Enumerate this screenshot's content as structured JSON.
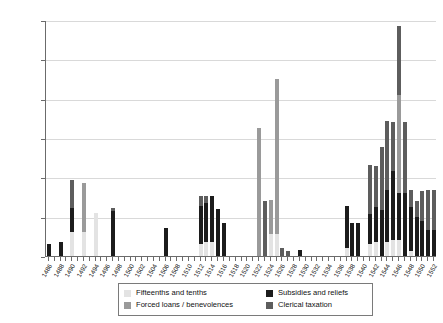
{
  "chart_data": {
    "type": "bar",
    "title": "",
    "xlabel": "",
    "ylabel": "",
    "ylim": [
      0,
      300000
    ],
    "ytick_values": [
      0,
      50000,
      100000,
      150000,
      200000,
      250000,
      300000
    ],
    "ytick_labels": [
      "0",
      "50000",
      "100000",
      "150000",
      "200000",
      "250000",
      "300000"
    ],
    "grid": true,
    "stacked": true,
    "legend_position": "bottom-center",
    "series": [
      {
        "name": "Fifteenths and tenths",
        "color": "#e3e3e3"
      },
      {
        "name": "Subsidies and reliefs",
        "color": "#1c1c1c"
      },
      {
        "name": "Forced loans / benevolences",
        "color": "#9a9a9a"
      },
      {
        "name": "Clerical taxation",
        "color": "#5d5d5d"
      }
    ],
    "categories": [
      "1486",
      "1487",
      "1488",
      "1489",
      "1490",
      "1491",
      "1492",
      "1493",
      "1494",
      "1495",
      "1496",
      "1497",
      "1498",
      "1499",
      "1500",
      "1501",
      "1502",
      "1503",
      "1504",
      "1505",
      "1506",
      "1507",
      "1508",
      "1509",
      "1510",
      "1511",
      "1512",
      "1513",
      "1514",
      "1515",
      "1516",
      "1517",
      "1518",
      "1519",
      "1520",
      "1521",
      "1522",
      "1523",
      "1524",
      "1525",
      "1526",
      "1527",
      "1528",
      "1529",
      "1530",
      "1531",
      "1532",
      "1533",
      "1534",
      "1535",
      "1536",
      "1537",
      "1538",
      "1539",
      "1540",
      "1541",
      "1542",
      "1543",
      "1544",
      "1545",
      "1546",
      "1547",
      "1548",
      "1549",
      "1550",
      "1551",
      "1552"
    ],
    "xtick_labels": [
      "1486",
      "1488",
      "1490",
      "1492",
      "1494",
      "1496",
      "1498",
      "1500",
      "1502",
      "1504",
      "1506",
      "1508",
      "1510",
      "1512",
      "1514",
      "1516",
      "1518",
      "1520",
      "1522",
      "1524",
      "1526",
      "1528",
      "1530",
      "1532",
      "1534",
      "1536",
      "1538",
      "1540",
      "1542",
      "1544",
      "1546",
      "1548",
      "1550",
      "1552"
    ],
    "values": {
      "Fifteenths and tenths": [
        0,
        0,
        0,
        0,
        30000,
        0,
        30000,
        0,
        55000,
        0,
        0,
        0,
        0,
        0,
        0,
        0,
        0,
        0,
        0,
        0,
        0,
        0,
        0,
        0,
        0,
        0,
        15000,
        18000,
        18000,
        0,
        0,
        0,
        0,
        0,
        0,
        0,
        0,
        0,
        28000,
        28000,
        0,
        0,
        0,
        0,
        0,
        0,
        0,
        0,
        0,
        0,
        0,
        10000,
        0,
        0,
        0,
        15000,
        18000,
        0,
        18000,
        20000,
        20000,
        0,
        6000,
        0,
        0,
        0,
        0
      ],
      "Subsidies and reliefs": [
        15000,
        0,
        18000,
        0,
        31000,
        0,
        0,
        0,
        0,
        0,
        0,
        57000,
        0,
        0,
        0,
        0,
        0,
        0,
        0,
        0,
        35000,
        0,
        0,
        0,
        0,
        0,
        48000,
        50000,
        58000,
        60000,
        42000,
        0,
        0,
        0,
        0,
        0,
        0,
        0,
        0,
        0,
        0,
        0,
        0,
        8000,
        0,
        0,
        0,
        0,
        0,
        0,
        0,
        53000,
        42000,
        42000,
        0,
        38000,
        44000,
        58000,
        66000,
        88000,
        60000,
        80000,
        56000,
        50000,
        44000,
        33000,
        33000
      ],
      "Forced loans / benevolences": [
        0,
        0,
        0,
        0,
        0,
        0,
        63000,
        0,
        0,
        0,
        0,
        0,
        0,
        0,
        0,
        0,
        0,
        0,
        0,
        0,
        0,
        0,
        0,
        0,
        0,
        0,
        0,
        0,
        0,
        0,
        0,
        0,
        0,
        0,
        0,
        0,
        163000,
        0,
        43000,
        197000,
        0,
        0,
        0,
        0,
        0,
        0,
        0,
        0,
        0,
        0,
        0,
        0,
        0,
        0,
        0,
        0,
        0,
        0,
        0,
        0,
        125000,
        0,
        0,
        0,
        0,
        0,
        0
      ],
      "Clerical taxation": [
        0,
        0,
        0,
        0,
        35000,
        0,
        0,
        0,
        0,
        0,
        0,
        4000,
        0,
        0,
        0,
        0,
        0,
        0,
        0,
        0,
        0,
        0,
        0,
        0,
        0,
        0,
        13000,
        8000,
        0,
        0,
        0,
        0,
        0,
        0,
        0,
        0,
        0,
        70000,
        0,
        0,
        10000,
        6000,
        0,
        0,
        0,
        0,
        0,
        0,
        0,
        0,
        0,
        0,
        0,
        0,
        0,
        63000,
        53000,
        80000,
        87000,
        62000,
        88000,
        90000,
        22000,
        20000,
        39000,
        51000,
        51000
      ]
    },
    "totals": [
      15000,
      0,
      18000,
      0,
      96000,
      0,
      93000,
      0,
      55000,
      0,
      0,
      61000,
      0,
      0,
      0,
      0,
      0,
      0,
      0,
      0,
      35000,
      0,
      0,
      0,
      0,
      0,
      76000,
      76000,
      76000,
      60000,
      42000,
      0,
      0,
      0,
      0,
      0,
      163000,
      70000,
      89000,
      225000,
      10000,
      6000,
      0,
      8000,
      0,
      0,
      0,
      0,
      0,
      0,
      0,
      63000,
      42000,
      42000,
      0,
      116000,
      115000,
      138000,
      171000,
      170000,
      293000,
      170000,
      84000,
      70000,
      83000,
      84000,
      84000
    ]
  },
  "legend": {
    "items": [
      {
        "label": "Fifteenths and tenths",
        "color": "#e3e3e3"
      },
      {
        "label": "Subsidies and reliefs",
        "color": "#1c1c1c"
      },
      {
        "label": "Forced loans / benevolences",
        "color": "#9a9a9a"
      },
      {
        "label": "Clerical taxation",
        "color": "#5d5d5d"
      }
    ]
  }
}
